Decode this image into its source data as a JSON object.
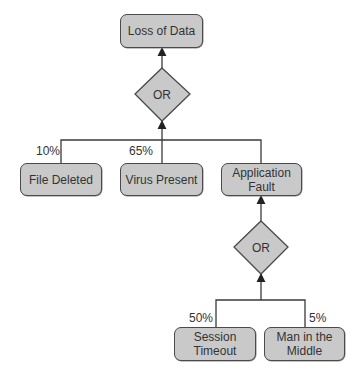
{
  "diagram": {
    "type": "fault-tree",
    "top_event": {
      "label": "Loss of Data"
    },
    "gates": [
      {
        "id": "gate1",
        "label": "OR",
        "type": "OR"
      },
      {
        "id": "gate2",
        "label": "OR",
        "type": "OR"
      }
    ],
    "events": [
      {
        "id": "file_deleted",
        "label": "File Deleted",
        "probability": "10%"
      },
      {
        "id": "virus_present",
        "label": "Virus Present",
        "probability": "65%"
      },
      {
        "id": "application_fault",
        "label": "Application Fault",
        "probability": ""
      },
      {
        "id": "session_timeout",
        "label": "Session Timeout",
        "probability": "50%"
      },
      {
        "id": "man_in_the_middle",
        "label": "Man in the Middle",
        "probability": "5%"
      }
    ],
    "colors": {
      "node_fill": "#c9c9c9",
      "node_border": "#4a4a4a",
      "line": "#3a3a3a",
      "text": "#333333"
    }
  }
}
